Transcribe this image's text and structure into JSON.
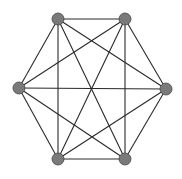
{
  "diagram": {
    "type": "complete-graph",
    "name": "K6",
    "colors": {
      "edge": "#2a2a2a",
      "node_fill": "#7a7a7a",
      "node_stroke": "#444444",
      "background": "#ffffff"
    },
    "node_radius": 6,
    "nodes": [
      {
        "id": "top-left",
        "x": 58,
        "y": 19
      },
      {
        "id": "top-right",
        "x": 125,
        "y": 19
      },
      {
        "id": "right",
        "x": 166,
        "y": 89
      },
      {
        "id": "bottom-right",
        "x": 125,
        "y": 159
      },
      {
        "id": "bottom-left",
        "x": 58,
        "y": 159
      },
      {
        "id": "left",
        "x": 19,
        "y": 88
      }
    ],
    "edges": [
      [
        0,
        1
      ],
      [
        0,
        2
      ],
      [
        0,
        3
      ],
      [
        0,
        4
      ],
      [
        0,
        5
      ],
      [
        1,
        2
      ],
      [
        1,
        3
      ],
      [
        1,
        4
      ],
      [
        1,
        5
      ],
      [
        2,
        3
      ],
      [
        2,
        4
      ],
      [
        2,
        5
      ],
      [
        3,
        4
      ],
      [
        3,
        5
      ],
      [
        4,
        5
      ]
    ]
  }
}
